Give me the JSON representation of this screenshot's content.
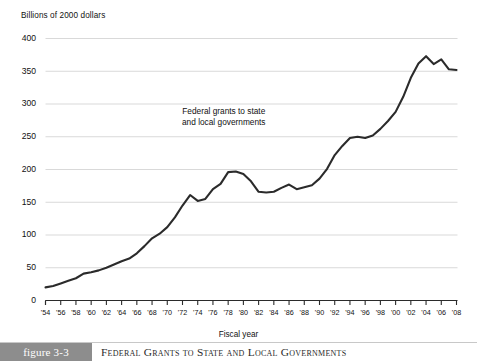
{
  "axes": {
    "y_title": "Billions of 2000 dollars",
    "x_title": "Fiscal year"
  },
  "annotation": {
    "line1": "Federal grants to state",
    "line2": "and local governments"
  },
  "caption": {
    "number": "figure 3-3",
    "title": "Federal Grants to State and Local Governments"
  },
  "colors": {
    "line": "#2b2b2b",
    "grid": "#d9d9d9",
    "axis": "#2b2b2b",
    "caption_box": "#8d8d8d",
    "caption_text": "#ffffff"
  },
  "chart_data": {
    "type": "line",
    "title": "Federal Grants to State and Local Governments",
    "xlabel": "Fiscal year",
    "ylabel": "Billions of 2000 dollars",
    "ylim": [
      0,
      400
    ],
    "yticks": [
      0,
      50,
      100,
      150,
      200,
      250,
      300,
      350,
      400
    ],
    "ytick_labels": [
      "0",
      "50",
      "100",
      "150",
      "200",
      "250",
      "300",
      "350",
      "400"
    ],
    "xlim": [
      1954,
      2008
    ],
    "xticks": [
      1954,
      1956,
      1958,
      1960,
      1962,
      1964,
      1966,
      1968,
      1970,
      1972,
      1974,
      1976,
      1978,
      1980,
      1982,
      1984,
      1986,
      1988,
      1990,
      1992,
      1994,
      1996,
      1998,
      2000,
      2002,
      2004,
      2006,
      2008
    ],
    "xtick_labels": [
      "'54",
      "'56",
      "'58",
      "'60",
      "'62",
      "'64",
      "'66",
      "'68",
      "'70",
      "'72",
      "'74",
      "'76",
      "'78",
      "'80",
      "'82",
      "'84",
      "'86",
      "'88",
      "'90",
      "'92",
      "'94",
      "'96",
      "'98",
      "'00",
      "'02",
      "'04",
      "'06",
      "'08"
    ],
    "grid": "horizontal",
    "legend": "none",
    "annotations": [
      "Federal grants to state and local governments"
    ],
    "series": [
      {
        "name": "Federal grants to state and local governments",
        "x": [
          1954,
          1955,
          1956,
          1957,
          1958,
          1959,
          1960,
          1961,
          1962,
          1963,
          1964,
          1965,
          1966,
          1967,
          1968,
          1969,
          1970,
          1971,
          1972,
          1973,
          1974,
          1975,
          1976,
          1977,
          1978,
          1979,
          1980,
          1981,
          1982,
          1983,
          1984,
          1985,
          1986,
          1987,
          1988,
          1989,
          1990,
          1991,
          1992,
          1993,
          1994,
          1995,
          1996,
          1997,
          1998,
          1999,
          2000,
          2001,
          2002,
          2003,
          2004,
          2005,
          2006,
          2007,
          2008
        ],
        "values": [
          20,
          22,
          26,
          30,
          34,
          41,
          43,
          46,
          50,
          55,
          60,
          64,
          72,
          83,
          95,
          102,
          112,
          127,
          145,
          161,
          152,
          155,
          170,
          178,
          196,
          197,
          193,
          182,
          166,
          165,
          166,
          172,
          177,
          170,
          173,
          176,
          186,
          201,
          222,
          236,
          248,
          250,
          248,
          252,
          262,
          274,
          288,
          311,
          340,
          362,
          373,
          361,
          368,
          353,
          352
        ],
        "color": "#2b2b2b"
      }
    ]
  }
}
